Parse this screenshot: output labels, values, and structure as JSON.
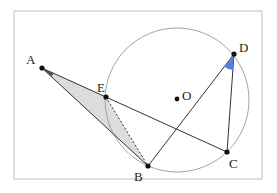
{
  "figure": {
    "frame": {
      "x": 14,
      "y": 11,
      "width": 248,
      "height": 168,
      "stroke": "#bdbdbd"
    },
    "circle": {
      "center_label": "O",
      "cx": 177,
      "cy": 100,
      "r": 72,
      "stroke": "#9a9a9a"
    },
    "points": {
      "A": {
        "label": "A",
        "x": 42,
        "y": 68
      },
      "E": {
        "label": "E",
        "x": 106,
        "y": 97
      },
      "B": {
        "label": "B",
        "x": 148,
        "y": 166
      },
      "C": {
        "label": "C",
        "x": 227,
        "y": 152
      },
      "D": {
        "label": "D",
        "x": 234,
        "y": 54
      },
      "O": {
        "label": "O",
        "x": 177,
        "y": 99
      }
    },
    "segments": [
      "A-C",
      "A-B",
      "E-B (dashed)",
      "B-D",
      "D-C"
    ],
    "shaded_triangle": {
      "vertices": [
        "A",
        "E",
        "B"
      ],
      "fill": "#dcdcdc"
    },
    "angle_marks": [
      {
        "at": "D",
        "between": [
          "B",
          "C"
        ],
        "fill": "#5b7fdb"
      },
      {
        "at": "A",
        "between": [
          "E",
          "B"
        ],
        "fill": "#555555"
      }
    ],
    "colors": {
      "line": "#333333",
      "point": "#111111",
      "shade": "#dcdcdc",
      "angle_blue": "#5b7fdb"
    }
  }
}
